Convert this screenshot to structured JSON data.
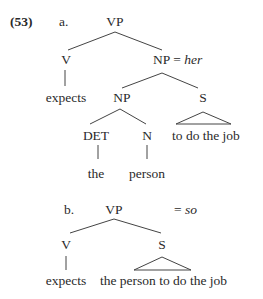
{
  "example": {
    "number": "(53)",
    "a": {
      "label": "a.",
      "nodes": {
        "vp": "VP",
        "v": "V",
        "np_top": "NP",
        "np_top_eq": "=",
        "np_top_value": "her",
        "expects": "expects",
        "np_inner": "NP",
        "s": "S",
        "det": "DET",
        "n": "N",
        "s_content": "to do the job",
        "the": "the",
        "person": "person"
      }
    },
    "b": {
      "label": "b.",
      "nodes": {
        "vp": "VP",
        "vp_eq": "=",
        "vp_value": "so",
        "v": "V",
        "s": "S",
        "expects": "expects",
        "s_content": "the person to do the job"
      }
    }
  },
  "colors": {
    "text": "#2a2a2a",
    "lines": "#444444",
    "background": "#ffffff"
  }
}
